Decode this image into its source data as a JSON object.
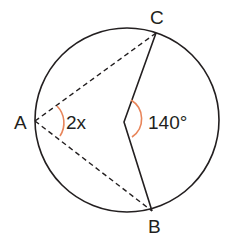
{
  "diagram": {
    "points": {
      "A": {
        "label": "A"
      },
      "B": {
        "label": "B"
      },
      "C": {
        "label": "C"
      }
    },
    "angles": {
      "inscribed": {
        "label": "2x",
        "vertex": "A"
      },
      "central": {
        "label": "140°",
        "vertex": "O"
      }
    },
    "colors": {
      "stroke": "#231f20",
      "angle_arc": "#e8855a"
    }
  }
}
